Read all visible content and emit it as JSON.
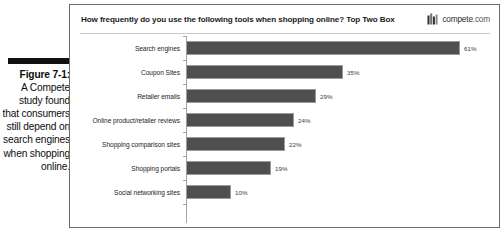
{
  "figure": {
    "label": "Figure 7-1:",
    "body": "A Compete study found that consumers still depend on search engines when shopping online."
  },
  "panel": {
    "title": "How frequently do you use the following tools when shopping online? Top Two Box",
    "brand_name": "compete",
    "brand_suffix": ".com",
    "brand_icon": "bar-chart-logo-icon"
  },
  "chart_data": {
    "type": "bar",
    "orientation": "horizontal",
    "title": "How frequently do you use the following tools when shopping online? Top Two Box",
    "xlabel": "",
    "ylabel": "",
    "xlim": [
      0,
      65
    ],
    "grid": false,
    "legend": "none",
    "categories": [
      "Search engines",
      "Coupon Sites",
      "Retailer emails",
      "Online product/retailer reviews",
      "Shopping comparison sites",
      "Shopping portals",
      "Social networking sites"
    ],
    "values": [
      61,
      35,
      29,
      24,
      22,
      19,
      10
    ],
    "value_labels": [
      "61%",
      "35%",
      "29%",
      "24%",
      "22%",
      "19%",
      "10%"
    ],
    "bar_color": "#4f4f4f"
  }
}
